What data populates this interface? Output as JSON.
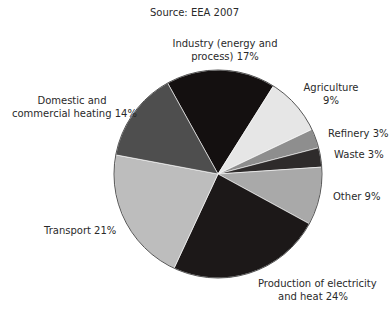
{
  "chart_data": {
    "type": "pie",
    "title": "Source: EEA 2007",
    "slices": [
      {
        "label": "Industry (energy and process)",
        "value": 17,
        "color": "#141010"
      },
      {
        "label": "Agriculture",
        "value": 9,
        "color": "#e6e6e6"
      },
      {
        "label": "Refinery",
        "value": 3,
        "color": "#8e8e8e"
      },
      {
        "label": "Waste",
        "value": 3,
        "color": "#2e2b2b"
      },
      {
        "label": "Other",
        "value": 9,
        "color": "#a9a9a9"
      },
      {
        "label": "Production of electricity and heat",
        "value": 24,
        "color": "#1c1818"
      },
      {
        "label": "Transport",
        "value": 21,
        "color": "#bdbdbd"
      },
      {
        "label": "Domestic and commercial heating",
        "value": 14,
        "color": "#4e4e4e"
      }
    ],
    "start_angle_deg": -29,
    "legend": "none (direct labels)"
  },
  "labels": {
    "title": "Source: EEA 2007",
    "industry_1": "Industry (energy and",
    "industry_2": "process) 17%",
    "agriculture_1": "Agriculture",
    "agriculture_2": "9%",
    "refinery": "Refinery 3%",
    "waste": "Waste 3%",
    "other": "Other 9%",
    "production_1": "Production of electricity",
    "production_2": "and heat 24%",
    "transport": "Transport 21%",
    "domestic_1": "Domestic and",
    "domestic_2": "commercial heating 14%"
  }
}
